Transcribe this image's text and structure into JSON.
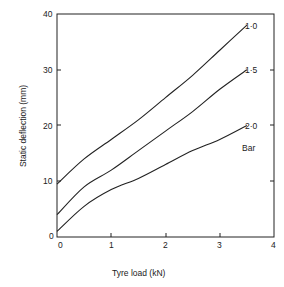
{
  "chart_data": {
    "type": "line",
    "title": "",
    "xlabel": "Tyre load (kN)",
    "ylabel": "Static deflection (mm)",
    "xlim": [
      0,
      4
    ],
    "ylim": [
      0,
      40
    ],
    "xticks": [
      "0",
      "1",
      "2",
      "3",
      "4"
    ],
    "yticks": [
      "0",
      "10",
      "20",
      "30",
      "40"
    ],
    "grid": false,
    "legend": "inline labels at line ends",
    "annotation": "Bar",
    "x": [
      0,
      0.5,
      1,
      1.5,
      2,
      2.5,
      3,
      3.5
    ],
    "series": [
      {
        "name": "1·0",
        "values": [
          9.5,
          14,
          17.5,
          21,
          25,
          29,
          33.5,
          38
        ]
      },
      {
        "name": "1·5",
        "values": [
          4,
          9,
          12,
          15.5,
          19,
          22.5,
          26.5,
          30
        ]
      },
      {
        "name": "2·0",
        "values": [
          1,
          5.5,
          8.5,
          10.5,
          13,
          15.5,
          17.5,
          20
        ]
      }
    ]
  },
  "labels": {
    "series_1": "1·0",
    "series_2": "1·5",
    "series_3": "2·0",
    "unit": "Bar",
    "xlabel": "Tyre load (kN)",
    "ylabel": "Static deflection (mm)",
    "x0": "0",
    "x1": "1",
    "x2": "2",
    "x3": "3",
    "x4": "4",
    "y0": "0",
    "y10": "10",
    "y20": "20",
    "y30": "30",
    "y40": "40"
  }
}
